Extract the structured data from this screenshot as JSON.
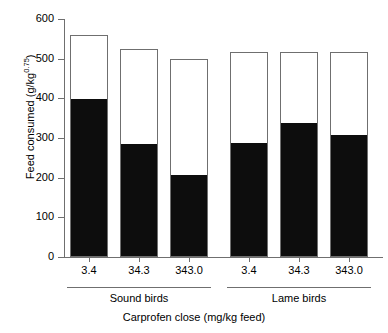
{
  "chart_data": {
    "type": "bar",
    "title": "",
    "xlabel": "Carprofen close (mg/kg feed)",
    "ylabel": "Feed consumed (g/kg",
    "ylabel_sup": "0.75",
    "ylabel_suffix": ")",
    "ylim": [
      0,
      600
    ],
    "yticks": [
      600,
      500,
      400,
      300,
      200,
      100,
      0
    ],
    "ytick_labels": [
      "600",
      "500",
      "400",
      "300",
      "200",
      "100",
      "0"
    ],
    "grid": false,
    "legend": "none",
    "stacked": true,
    "categories": [
      "3.4",
      "34.3",
      "343.0",
      "3.4",
      "34.3",
      "343.0"
    ],
    "groups": [
      {
        "label": "Sound birds",
        "categories": [
          "3.4",
          "34.3",
          "343.0"
        ]
      },
      {
        "label": "Lame birds",
        "categories": [
          "3.4",
          "34.3",
          "343.0"
        ]
      }
    ],
    "series": [
      {
        "name": "black-segment",
        "color": "#0d0d0d",
        "values": [
          395,
          283,
          205,
          286,
          335,
          305
        ]
      },
      {
        "name": "total-bar",
        "color": "#ffffff",
        "values": [
          560,
          525,
          500,
          517,
          517,
          517
        ]
      }
    ],
    "bars": [
      {
        "category": "3.4",
        "group": "Sound birds",
        "total": 560,
        "filled": 395
      },
      {
        "category": "34.3",
        "group": "Sound birds",
        "total": 525,
        "filled": 283
      },
      {
        "category": "343.0",
        "group": "Sound birds",
        "total": 500,
        "filled": 205
      },
      {
        "category": "3.4",
        "group": "Lame birds",
        "total": 517,
        "filled": 286
      },
      {
        "category": "34.3",
        "group": "Lame birds",
        "total": 517,
        "filled": 335
      },
      {
        "category": "343.0",
        "group": "Lame birds",
        "total": 517,
        "filled": 305
      }
    ],
    "colors": {
      "bar_fill": "#0d0d0d",
      "bar_empty": "#ffffff",
      "bar_edge": "#6f6f6f",
      "axis": "#6f6f6f",
      "text": "#000000"
    }
  }
}
